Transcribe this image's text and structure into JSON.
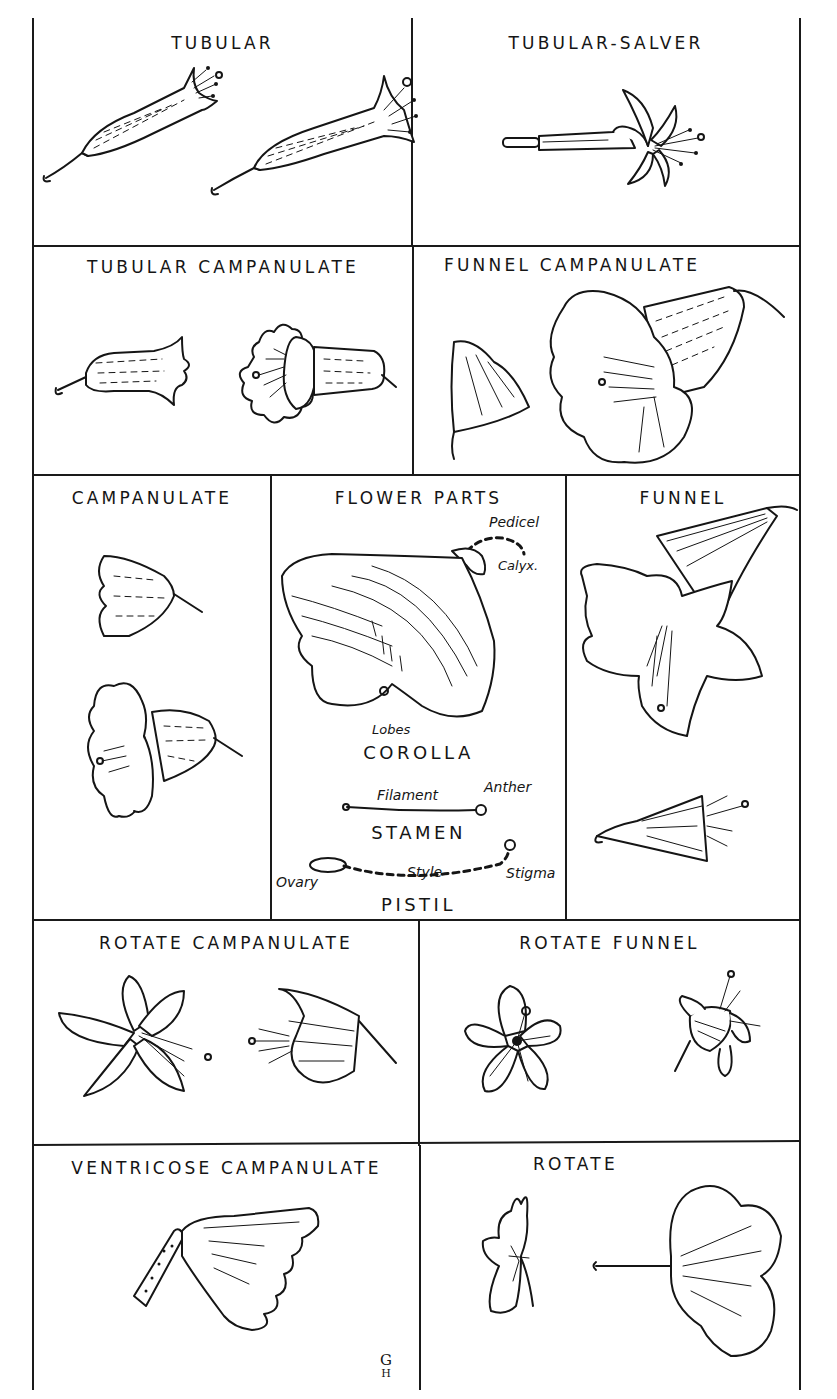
{
  "figure": {
    "title_strip": "",
    "cells": [
      {
        "id": "tubular",
        "title": "TUBULAR"
      },
      {
        "id": "tubular-salver",
        "title": "TUBULAR-SALVER"
      },
      {
        "id": "tubular-campanulate",
        "title": "TUBULAR CAMPANULATE"
      },
      {
        "id": "funnel-campanulate",
        "title": "FUNNEL CAMPANULATE"
      },
      {
        "id": "campanulate",
        "title": "CAMPANULATE"
      },
      {
        "id": "flower-parts",
        "title": "FLOWER PARTS"
      },
      {
        "id": "funnel",
        "title": "FUNNEL"
      },
      {
        "id": "rotate-campanulate",
        "title": "ROTATE CAMPANULATE"
      },
      {
        "id": "rotate-funnel",
        "title": "ROTATE FUNNEL"
      },
      {
        "id": "ventricose-campanulate",
        "title": "VENTRICOSE CAMPANULATE"
      },
      {
        "id": "rotate",
        "title": "ROTATE"
      }
    ],
    "flower_parts": {
      "labels": {
        "pedicel": "Pedicel",
        "calyx": "Calyx.",
        "lobes": "Lobes",
        "corolla": "COROLLA",
        "filament": "Filament",
        "anther": "Anther",
        "stamen": "STAMEN",
        "ovary": "Ovary",
        "style": "Style",
        "stigma": "Stigma",
        "pistil": "PISTIL"
      }
    },
    "signature": {
      "top": "G",
      "bottom": "H"
    }
  }
}
